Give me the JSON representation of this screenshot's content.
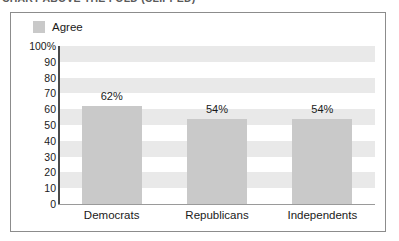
{
  "clipped_title": {
    "text": "CHART ABOVE THE FOLD (CLIPPED)",
    "note": "top heading row is cut off at the image edge and not legible"
  },
  "chart_data": {
    "type": "bar",
    "title": "",
    "xlabel": "",
    "ylabel": "",
    "categories": [
      "Democrats",
      "Republicans",
      "Independents"
    ],
    "values": [
      62,
      54,
      54
    ],
    "value_labels": [
      "62%",
      "54%",
      "54%"
    ],
    "series": [
      {
        "name": "Agree",
        "values": [
          62,
          54,
          54
        ]
      }
    ],
    "ylim": [
      0,
      100
    ],
    "ytick_labels": [
      "100%",
      "90",
      "80",
      "70",
      "60",
      "50",
      "40",
      "30",
      "20",
      "10",
      "0"
    ],
    "ytick_values": [
      100,
      90,
      80,
      70,
      60,
      50,
      40,
      30,
      20,
      10,
      0
    ],
    "grid": false,
    "banded_background": true,
    "legend": {
      "position": "top-left",
      "entries": [
        {
          "label": "Agree",
          "color": "#c9c9c9"
        }
      ]
    },
    "colors": {
      "bar_fill": "#c9c9c9",
      "band": "#e9e9e9",
      "plot_background": "#ffffff",
      "frame_border": "#8c8c8c",
      "axis": "#4a4a4a",
      "text": "#1a1a1a"
    }
  }
}
